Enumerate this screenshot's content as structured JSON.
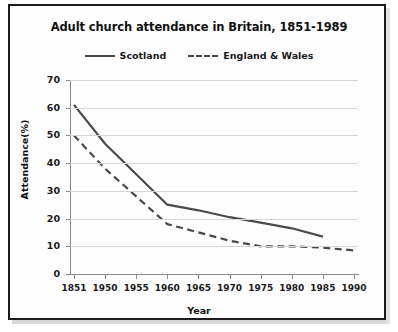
{
  "chart_data": {
    "type": "line",
    "title": "Adult church attendance in Britain, 1851-1989",
    "xlabel": "Year",
    "ylabel": "Attendance(%)",
    "categories": [
      "1851",
      "1950",
      "1955",
      "1960",
      "1965",
      "1970",
      "1975",
      "1980",
      "1985",
      "1990"
    ],
    "ylim": [
      0,
      70
    ],
    "ytick_labels": [
      "0",
      "10",
      "20",
      "30",
      "40",
      "50",
      "60",
      "70"
    ],
    "ytick_step": 10,
    "grid": true,
    "legend_position": "top-center",
    "series": [
      {
        "name": "Scotland",
        "style": "solid",
        "color": "#4a4a4a",
        "values": [
          61,
          47,
          36,
          25,
          23,
          20.5,
          18.5,
          16.5,
          13.5,
          null
        ]
      },
      {
        "name": "England & Wales",
        "style": "dashed",
        "color": "#4a4a4a",
        "values": [
          50,
          38,
          28,
          18,
          15,
          12,
          10,
          10,
          9.5,
          8.5
        ]
      }
    ]
  }
}
